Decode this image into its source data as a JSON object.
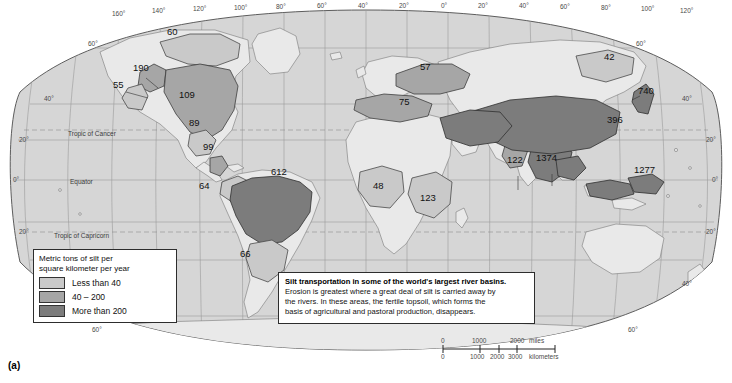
{
  "figure": {
    "panel_label": "(a)",
    "width": 732,
    "height": 383
  },
  "legend": {
    "title_line1": "Metric tons of silt per",
    "title_line2": "square kilometer per year",
    "classes": [
      {
        "label": "Less than 40",
        "color": "#c9c9c9",
        "key": "low"
      },
      {
        "label": "40 – 200",
        "color": "#a6a6a6",
        "key": "mid"
      },
      {
        "label": "More than 200",
        "color": "#7c7c7c",
        "key": "high"
      }
    ]
  },
  "caption": {
    "title": "Silt transportation in some of the world's largest river basins.",
    "line1": "Erosion is greatest where a great deal of silt is carried away by",
    "line2": "the rivers.  In these areas, the fertile topsoil, which forms the",
    "line3": "basis of agricultural and pastoral production, disappears."
  },
  "scale_bar": {
    "miles": {
      "ticks": [
        "0",
        "1000",
        "2000"
      ],
      "unit": "miles"
    },
    "kilometers": {
      "ticks": [
        "0",
        "1000",
        "2000",
        "3000"
      ],
      "unit": "kilometers"
    }
  },
  "graticule": {
    "longitude_labels": [
      "160°",
      "140°",
      "120°",
      "100°",
      "80°",
      "60°",
      "40°",
      "20°",
      "0°",
      "20°",
      "40°",
      "60°",
      "80°",
      "100°",
      "120°",
      "140°",
      "160°"
    ],
    "latitude_labels_left": [
      "60°",
      "40°",
      "20°",
      "0°",
      "20°",
      "40°",
      "60°"
    ],
    "latitude_labels_right": [
      "60°",
      "40°",
      "20°",
      "0°",
      "20°",
      "40°",
      "60°"
    ],
    "named_lines": [
      "Tropic of Cancer",
      "Equator",
      "Tropic of Capricorn"
    ]
  },
  "chart_data": {
    "type": "map",
    "title": "Silt transportation in some of the world's largest river basins.",
    "value_unit": "metric tons of silt per square kilometer per year",
    "classes": [
      {
        "label": "Less than 40",
        "range": [
          0,
          40
        ],
        "color": "#c9c9c9"
      },
      {
        "label": "40 – 200",
        "range": [
          40,
          200
        ],
        "color": "#a6a6a6"
      },
      {
        "label": "More than 200",
        "range": [
          200,
          null
        ],
        "color": "#7c7c7c"
      }
    ],
    "basins": [
      {
        "name": "Mackenzie",
        "value": 60,
        "class": "low",
        "x": 180,
        "y": 48,
        "lx": 167,
        "ly": 35
      },
      {
        "name": "Yukon",
        "value": 190,
        "class": "mid",
        "x": 148,
        "y": 80,
        "lx": 133,
        "ly": 71
      },
      {
        "name": "Fraser/Columbia",
        "value": 55,
        "class": "low",
        "x": 128,
        "y": 96,
        "lx": 113,
        "ly": 88
      },
      {
        "name": "Mississippi",
        "value": 109,
        "class": "mid",
        "x": 196,
        "y": 108,
        "lx": 179,
        "ly": 98
      },
      {
        "name": "Rio Grande",
        "value": 89,
        "class": "low",
        "x": 200,
        "y": 134,
        "lx": 189,
        "ly": 126
      },
      {
        "name": "Magdalena",
        "value": 99,
        "class": "mid",
        "x": 216,
        "y": 158,
        "lx": 203,
        "ly": 150
      },
      {
        "name": "Orinoco",
        "value": 64,
        "class": "low",
        "x": 213,
        "y": 196,
        "lx": 199,
        "ly": 189
      },
      {
        "name": "Amazon",
        "value": 612,
        "class": "high",
        "x": 278,
        "y": 182,
        "lx": 271,
        "ly": 175
      },
      {
        "name": "Paraná",
        "value": 66,
        "class": "low",
        "x": 252,
        "y": 264,
        "lx": 240,
        "ly": 257
      },
      {
        "name": "Danube/Volga",
        "value": 57,
        "class": "mid",
        "x": 430,
        "y": 78,
        "lx": 420,
        "ly": 70
      },
      {
        "name": "Mediterranean",
        "value": 75,
        "class": "mid",
        "x": 410,
        "y": 112,
        "lx": 399,
        "ly": 105
      },
      {
        "name": "Niger",
        "value": 48,
        "class": "low",
        "x": 385,
        "y": 196,
        "lx": 373,
        "ly": 189
      },
      {
        "name": "Zambezi",
        "value": 123,
        "class": "low",
        "x": 432,
        "y": 208,
        "lx": 420,
        "ly": 201
      },
      {
        "name": "Indus",
        "value": 122,
        "class": "mid",
        "x": 512,
        "y": 171,
        "lx": 507,
        "ly": 163
      },
      {
        "name": "Ganges–Brahmaputra",
        "value": 1374,
        "class": "high",
        "x": 548,
        "y": 168,
        "lx": 536,
        "ly": 161
      },
      {
        "name": "Huang He",
        "value": 396,
        "class": "high",
        "x": 619,
        "y": 130,
        "lx": 607,
        "ly": 123
      },
      {
        "name": "Amur",
        "value": 42,
        "class": "low",
        "x": 614,
        "y": 67,
        "lx": 604,
        "ly": 60
      },
      {
        "name": "Japan rivers",
        "value": 740,
        "class": "high",
        "x": 648,
        "y": 101,
        "lx": 638,
        "ly": 94
      },
      {
        "name": "Indonesia / New Guinea",
        "value": 1277,
        "class": "high",
        "x": 646,
        "y": 180,
        "lx": 634,
        "ly": 173
      }
    ]
  }
}
